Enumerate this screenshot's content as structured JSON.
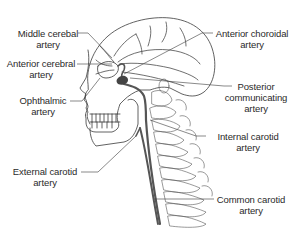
{
  "diagram": {
    "colors": {
      "background": "#ffffff",
      "line": "#3a3a3a",
      "artery": "#555555",
      "label_text": "#2a2a2a"
    },
    "labels": [
      {
        "id": "middle-cerebral",
        "lines": [
          "Middle cerebal",
          "artery"
        ],
        "side": "left"
      },
      {
        "id": "anterior-cerebral",
        "lines": [
          "Anterior cerebral",
          "artery"
        ],
        "side": "left"
      },
      {
        "id": "ophthalmic",
        "lines": [
          "Ophthalmic",
          "artery"
        ],
        "side": "left"
      },
      {
        "id": "external-carotid",
        "lines": [
          "External carotid",
          "artery"
        ],
        "side": "left"
      },
      {
        "id": "anterior-choroidal",
        "lines": [
          "Anterior choroidal",
          "artery"
        ],
        "side": "right"
      },
      {
        "id": "posterior-communicating",
        "lines": [
          "Posterior",
          "communicating",
          "artery"
        ],
        "side": "right"
      },
      {
        "id": "internal-carotid",
        "lines": [
          "Internal carotid",
          "artery"
        ],
        "side": "right"
      },
      {
        "id": "common-carotid",
        "lines": [
          "Common carotid",
          "artery"
        ],
        "side": "right"
      }
    ]
  }
}
